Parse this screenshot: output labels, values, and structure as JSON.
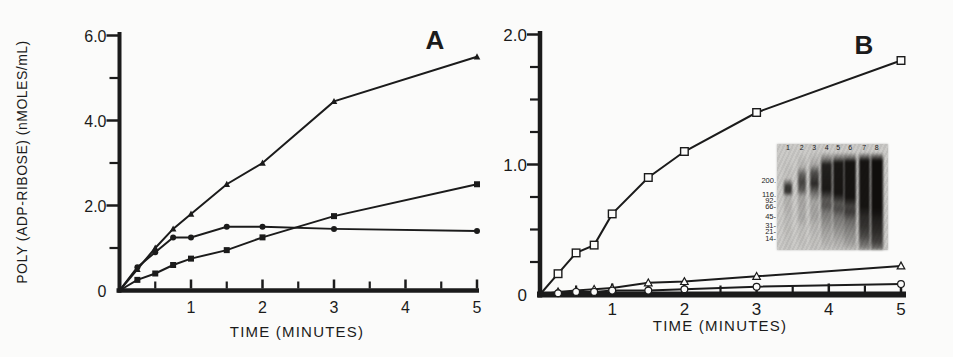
{
  "figure": {
    "background": "#fbfbfa",
    "ink": "#1b1b1b"
  },
  "chart_data": [
    {
      "type": "line",
      "panel_label": "A",
      "xlabel": "TIME (MINUTES)",
      "ylabel": "POLY (ADP-RIBOSE) (nMOLES/mL)",
      "xlim": [
        0,
        5
      ],
      "ylim": [
        0,
        6
      ],
      "grid": false,
      "legend": "none",
      "x_tick_labels": [
        "1",
        "2",
        "3",
        "4",
        "5"
      ],
      "x_tick_values": [
        1,
        2,
        3,
        4,
        5
      ],
      "x_minor_ticks": [
        0.5,
        1.5,
        2.5,
        3.5,
        4.5
      ],
      "y_tick_labels": [
        "0",
        "2.0",
        "4.0",
        "6.0"
      ],
      "y_tick_values": [
        0,
        2,
        4,
        6
      ],
      "y_minor_ticks": [
        1,
        3,
        5
      ],
      "x": [
        0,
        0.25,
        0.5,
        0.75,
        1,
        1.5,
        2,
        3,
        5
      ],
      "series": [
        {
          "name": "filled-triangle",
          "marker": "triangle-filled",
          "values": [
            0,
            0.5,
            1.0,
            1.45,
            1.8,
            2.5,
            3.0,
            4.45,
            5.5
          ]
        },
        {
          "name": "filled-circle",
          "marker": "circle-filled",
          "values": [
            0,
            0.55,
            0.9,
            1.25,
            1.25,
            1.5,
            1.5,
            1.45,
            1.4
          ]
        },
        {
          "name": "filled-square",
          "marker": "square-filled",
          "values": [
            0,
            0.25,
            0.4,
            0.6,
            0.75,
            0.95,
            1.25,
            1.75,
            2.5
          ]
        }
      ]
    },
    {
      "type": "line",
      "panel_label": "B",
      "xlabel": "TIME (MINUTES)",
      "ylabel": "",
      "xlim": [
        0,
        5
      ],
      "ylim": [
        0,
        2
      ],
      "grid": false,
      "legend": "none",
      "x_tick_labels": [
        "1",
        "2",
        "3",
        "4",
        "5"
      ],
      "x_tick_values": [
        1,
        2,
        3,
        4,
        5
      ],
      "x_minor_ticks": [
        0.5,
        1.5,
        2.5,
        3.5,
        4.5
      ],
      "y_tick_labels": [
        "0",
        "1.0",
        "2.0"
      ],
      "y_tick_values": [
        0,
        1,
        2
      ],
      "y_minor_ticks": [
        0.25,
        0.5,
        0.75,
        1.25,
        1.5,
        1.75
      ],
      "x": [
        0,
        0.25,
        0.5,
        0.75,
        1,
        1.5,
        2,
        3,
        5
      ],
      "series": [
        {
          "name": "open-square",
          "marker": "square-open",
          "values": [
            0,
            0.16,
            0.32,
            0.38,
            0.62,
            0.9,
            1.1,
            1.4,
            1.8
          ]
        },
        {
          "name": "open-triangle",
          "marker": "triangle-open",
          "values": [
            0,
            0.02,
            0.03,
            0.04,
            0.05,
            0.09,
            0.1,
            0.14,
            0.22
          ]
        },
        {
          "name": "open-circle",
          "marker": "circle-open",
          "values": [
            0,
            0.01,
            0.02,
            0.02,
            0.03,
            0.03,
            0.04,
            0.06,
            0.08
          ]
        }
      ]
    }
  ],
  "gel_inset": {
    "lane_numbers": [
      "1",
      "2",
      "3",
      "4",
      "5",
      "6",
      "7",
      "8"
    ],
    "mw_labels": [
      {
        "text": "200.",
        "pct": 35
      },
      {
        "text": "116.",
        "pct": 48
      },
      {
        "text": "92-",
        "pct": 53.5
      },
      {
        "text": "66-",
        "pct": 59
      },
      {
        "text": "45-",
        "pct": 69
      },
      {
        "text": "31-",
        "pct": 77.5
      },
      {
        "text": "21-",
        "pct": 83
      },
      {
        "text": "14-",
        "pct": 90
      }
    ],
    "lanes": [
      {
        "number": "1",
        "center": 11,
        "width": 8,
        "stops": [
          [
            0,
            0
          ],
          [
            26,
            0.05
          ],
          [
            31,
            0.5
          ],
          [
            34,
            0.78
          ],
          [
            40,
            0.8
          ],
          [
            45,
            0.15
          ],
          [
            70,
            0.08
          ],
          [
            100,
            0.02
          ]
        ]
      },
      {
        "number": "2",
        "center": 24.7,
        "width": 8,
        "stops": [
          [
            0,
            0
          ],
          [
            14,
            0.12
          ],
          [
            22,
            0.55
          ],
          [
            30,
            0.72
          ],
          [
            38,
            0.6
          ],
          [
            45,
            0.2
          ],
          [
            68,
            0.16
          ],
          [
            76,
            0.08
          ],
          [
            100,
            0.02
          ]
        ]
      },
      {
        "number": "3",
        "center": 37.3,
        "width": 9,
        "stops": [
          [
            0,
            0.02
          ],
          [
            12,
            0.18
          ],
          [
            20,
            0.65
          ],
          [
            32,
            0.85
          ],
          [
            42,
            0.45
          ],
          [
            50,
            0.2
          ],
          [
            66,
            0.2
          ],
          [
            76,
            0.1
          ],
          [
            100,
            0.03
          ]
        ]
      },
      {
        "number": "4",
        "center": 49.7,
        "width": 11,
        "stops": [
          [
            0,
            0.06
          ],
          [
            6,
            0.4
          ],
          [
            12,
            0.9
          ],
          [
            38,
            0.94
          ],
          [
            48,
            0.6
          ],
          [
            55,
            0.62
          ],
          [
            62,
            0.42
          ],
          [
            72,
            0.3
          ],
          [
            84,
            0.18
          ],
          [
            100,
            0.05
          ]
        ]
      },
      {
        "number": "5",
        "center": 61.3,
        "width": 11,
        "stops": [
          [
            0,
            0.06
          ],
          [
            5,
            0.45
          ],
          [
            10,
            0.95
          ],
          [
            42,
            0.96
          ],
          [
            52,
            0.62
          ],
          [
            58,
            0.66
          ],
          [
            66,
            0.45
          ],
          [
            78,
            0.3
          ],
          [
            90,
            0.16
          ],
          [
            100,
            0.05
          ]
        ]
      },
      {
        "number": "6",
        "center": 73.3,
        "width": 12,
        "stops": [
          [
            0,
            0.07
          ],
          [
            5,
            0.5
          ],
          [
            9,
            0.97
          ],
          [
            46,
            0.97
          ],
          [
            55,
            0.72
          ],
          [
            61,
            0.76
          ],
          [
            70,
            0.5
          ],
          [
            82,
            0.34
          ],
          [
            94,
            0.2
          ],
          [
            100,
            0.07
          ]
        ]
      },
      {
        "number": "7",
        "center": 87.3,
        "width": 11,
        "stops": [
          [
            0,
            0.1
          ],
          [
            4,
            0.55
          ],
          [
            8,
            0.97
          ],
          [
            55,
            0.97
          ],
          [
            66,
            0.85
          ],
          [
            76,
            0.8
          ],
          [
            86,
            0.68
          ],
          [
            96,
            0.42
          ],
          [
            100,
            0.22
          ]
        ]
      },
      {
        "number": "8",
        "center": 99.7,
        "width": 12,
        "stops": [
          [
            0,
            0.1
          ],
          [
            4,
            0.6
          ],
          [
            8,
            1
          ],
          [
            58,
            1
          ],
          [
            70,
            0.9
          ],
          [
            80,
            0.85
          ],
          [
            92,
            0.72
          ],
          [
            98,
            0.5
          ],
          [
            100,
            0.28
          ]
        ]
      }
    ]
  }
}
